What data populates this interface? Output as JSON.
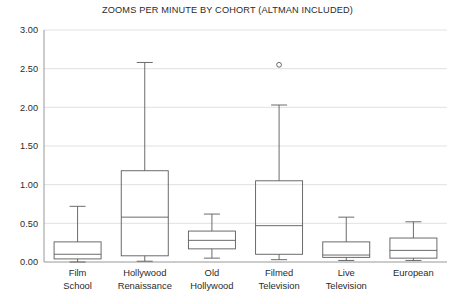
{
  "chart_data": {
    "type": "box",
    "title": "ZOOMS PER MINUTE BY COHORT (ALTMAN INCLUDED)",
    "xlabel": "",
    "ylabel": "",
    "ylim": [
      0.0,
      3.0
    ],
    "ytick_labels": [
      "0.00",
      "0.50",
      "1.00",
      "1.50",
      "2.00",
      "2.50",
      "3.00"
    ],
    "ytick_values": [
      0.0,
      0.5,
      1.0,
      1.5,
      2.0,
      2.5,
      3.0
    ],
    "grid": true,
    "legend": "none",
    "categories": [
      "Film School",
      "Hollywood Renaissance",
      "Old Hollywood",
      "Filmed Television",
      "Live Television",
      "European"
    ],
    "category_lines": [
      [
        "Film",
        "School"
      ],
      [
        "Hollywood",
        "Renaissance"
      ],
      [
        "Old",
        "Hollywood"
      ],
      [
        "Filmed",
        "Television"
      ],
      [
        "Live",
        "Television"
      ],
      [
        "European"
      ]
    ],
    "boxes": [
      {
        "category": "Film School",
        "whisker_low": 0.0,
        "q1": 0.04,
        "median": 0.1,
        "q3": 0.26,
        "whisker_high": 0.72,
        "outliers": []
      },
      {
        "category": "Hollywood Renaissance",
        "whisker_low": 0.01,
        "q1": 0.08,
        "median": 0.58,
        "q3": 1.18,
        "whisker_high": 2.58,
        "outliers": []
      },
      {
        "category": "Old Hollywood",
        "whisker_low": 0.05,
        "q1": 0.17,
        "median": 0.28,
        "q3": 0.4,
        "whisker_high": 0.62,
        "outliers": []
      },
      {
        "category": "Filmed Television",
        "whisker_low": 0.03,
        "q1": 0.1,
        "median": 0.47,
        "q3": 1.05,
        "whisker_high": 2.03,
        "outliers": [
          2.55
        ]
      },
      {
        "category": "Live Television",
        "whisker_low": 0.02,
        "q1": 0.06,
        "median": 0.09,
        "q3": 0.26,
        "whisker_high": 0.58,
        "outliers": []
      },
      {
        "category": "European",
        "whisker_low": 0.02,
        "q1": 0.05,
        "median": 0.15,
        "q3": 0.31,
        "whisker_high": 0.52,
        "outliers": []
      }
    ],
    "colors": {
      "background": "#ffffff",
      "gridline": "#d9d9d9",
      "axis": "#8c8c8c",
      "box_stroke": "#5b5b5b",
      "text": "#2b2b2b"
    }
  }
}
